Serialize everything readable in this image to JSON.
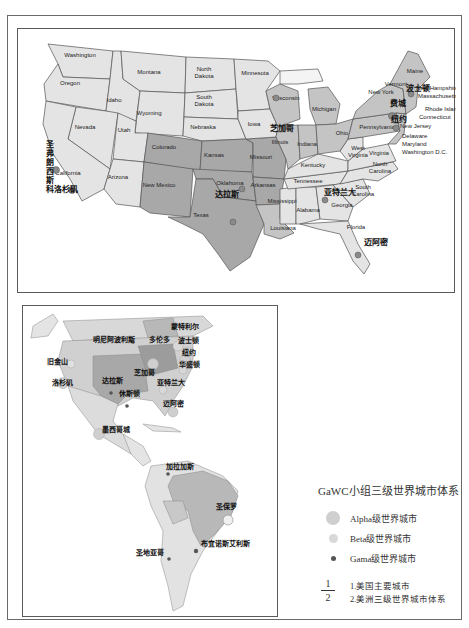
{
  "figure": {
    "panel_1_title": "美国主要城市",
    "panel_2_title": "美洲三级世界城市体系"
  },
  "us_map": {
    "states": [
      {
        "name": "Washington",
        "x": 62,
        "y": 28,
        "shade": "light"
      },
      {
        "name": "Oregon",
        "x": 52,
        "y": 56,
        "shade": "light"
      },
      {
        "name": "Idaho",
        "x": 96,
        "y": 73,
        "shade": "light"
      },
      {
        "name": "Montana",
        "x": 131,
        "y": 45,
        "shade": "light"
      },
      {
        "name": "Wyoming",
        "x": 131,
        "y": 86,
        "shade": "light"
      },
      {
        "name": "North Dakota",
        "x": 186,
        "y": 45,
        "shade": "light"
      },
      {
        "name": "South Dakota",
        "x": 186,
        "y": 73,
        "shade": "light"
      },
      {
        "name": "Nebraska",
        "x": 185,
        "y": 100,
        "shade": "light"
      },
      {
        "name": "Nevada",
        "x": 67,
        "y": 100,
        "shade": "light"
      },
      {
        "name": "Utah",
        "x": 106,
        "y": 103,
        "shade": "light"
      },
      {
        "name": "California",
        "x": 50,
        "y": 146,
        "shade": "light"
      },
      {
        "name": "Arizona",
        "x": 100,
        "y": 150,
        "shade": "light"
      },
      {
        "name": "Colorado",
        "x": 146,
        "y": 120,
        "shade": "dark"
      },
      {
        "name": "New Mexico",
        "x": 141,
        "y": 158,
        "shade": "dark"
      },
      {
        "name": "Kansas",
        "x": 196,
        "y": 128,
        "shade": "dark"
      },
      {
        "name": "Oklahoma",
        "x": 212,
        "y": 156,
        "shade": "dark"
      },
      {
        "name": "Texas",
        "x": 183,
        "y": 188,
        "shade": "dark"
      },
      {
        "name": "Minnesota",
        "x": 237,
        "y": 46,
        "shade": "light"
      },
      {
        "name": "Iowa",
        "x": 236,
        "y": 97,
        "shade": "light"
      },
      {
        "name": "Missouri",
        "x": 243,
        "y": 130,
        "shade": "dark"
      },
      {
        "name": "Arkansas",
        "x": 245,
        "y": 158,
        "shade": "dark"
      },
      {
        "name": "Louisiana",
        "x": 265,
        "y": 201,
        "shade": "mid"
      },
      {
        "name": "Wisconsin",
        "x": 268,
        "y": 71,
        "shade": "mid"
      },
      {
        "name": "Illinois",
        "x": 262,
        "y": 115,
        "shade": "mid"
      },
      {
        "name": "Michigan",
        "x": 306,
        "y": 82,
        "shade": "mid"
      },
      {
        "name": "Indiana",
        "x": 289,
        "y": 117,
        "shade": "mid"
      },
      {
        "name": "Ohio",
        "x": 324,
        "y": 106,
        "shade": "mid"
      },
      {
        "name": "Kentucky",
        "x": 295,
        "y": 138,
        "shade": "light"
      },
      {
        "name": "Tennessee",
        "x": 290,
        "y": 154,
        "shade": "light"
      },
      {
        "name": "Mississippi",
        "x": 264,
        "y": 174,
        "shade": "light"
      },
      {
        "name": "Alabama",
        "x": 290,
        "y": 183,
        "shade": "light"
      },
      {
        "name": "Georgia",
        "x": 324,
        "y": 178,
        "shade": "light"
      },
      {
        "name": "Florida",
        "x": 338,
        "y": 200,
        "shade": "light"
      },
      {
        "name": "South Carolina",
        "x": 345,
        "y": 163,
        "shade": "light"
      },
      {
        "name": "North Carolina",
        "x": 362,
        "y": 140,
        "shade": "light"
      },
      {
        "name": "Virginia",
        "x": 361,
        "y": 126,
        "shade": "light"
      },
      {
        "name": "West Virginia",
        "x": 340,
        "y": 124,
        "shade": "light"
      },
      {
        "name": "Pennsylvania",
        "x": 359,
        "y": 100,
        "shade": "mid"
      },
      {
        "name": "New York",
        "x": 363,
        "y": 65,
        "shade": "mid"
      },
      {
        "name": "Vermont",
        "x": 378,
        "y": 57,
        "shade": "mid"
      },
      {
        "name": "Maine",
        "x": 397,
        "y": 44,
        "shade": "mid"
      }
    ],
    "callouts": [
      {
        "name": "New Hampshire",
        "x": 398,
        "y": 61
      },
      {
        "name": "Massachusetts",
        "x": 400,
        "y": 69
      },
      {
        "name": "Rhode Island",
        "x": 407,
        "y": 82
      },
      {
        "name": "Connecticut",
        "x": 401,
        "y": 90
      },
      {
        "name": "New Jersey",
        "x": 382,
        "y": 99
      },
      {
        "name": "Delaware",
        "x": 384,
        "y": 109
      },
      {
        "name": "Maryland",
        "x": 384,
        "y": 117
      },
      {
        "name": "Washington D.C.",
        "x": 384,
        "y": 125
      }
    ],
    "cities": [
      {
        "name": "圣弗朗西斯科",
        "x": 28,
        "y": 118,
        "vertical": true
      },
      {
        "name": "洛杉矶",
        "x": 36,
        "y": 163
      },
      {
        "name": "达拉斯",
        "x": 197,
        "y": 168
      },
      {
        "name": "芝加哥",
        "x": 252,
        "y": 102
      },
      {
        "name": "亚特兰大",
        "x": 306,
        "y": 166
      },
      {
        "name": "迈阿密",
        "x": 346,
        "y": 216
      },
      {
        "name": "纽约",
        "x": 373,
        "y": 93
      },
      {
        "name": "波士顿",
        "x": 388,
        "y": 62
      },
      {
        "name": "费城",
        "x": 372,
        "y": 77
      }
    ]
  },
  "americas_map": {
    "cities": [
      {
        "name": "旧金山",
        "x": 24,
        "y": 58,
        "tier": "beta"
      },
      {
        "name": "明尼阿波利斯",
        "x": 70,
        "y": 36,
        "tier": "gama"
      },
      {
        "name": "多伦多",
        "x": 126,
        "y": 36,
        "tier": "alpha"
      },
      {
        "name": "蒙特利尔",
        "x": 148,
        "y": 23,
        "tier": "beta"
      },
      {
        "name": "波士顿",
        "x": 155,
        "y": 37,
        "tier": "beta"
      },
      {
        "name": "纽约",
        "x": 159,
        "y": 49,
        "tier": "alpha"
      },
      {
        "name": "华盛顿",
        "x": 156,
        "y": 61,
        "tier": "beta"
      },
      {
        "name": "芝加哥",
        "x": 111,
        "y": 69,
        "tier": "alpha"
      },
      {
        "name": "洛杉矶",
        "x": 29,
        "y": 79,
        "tier": "alpha"
      },
      {
        "name": "达拉斯",
        "x": 79,
        "y": 77,
        "tier": "beta"
      },
      {
        "name": "休斯顿",
        "x": 96,
        "y": 90,
        "tier": "gama"
      },
      {
        "name": "亚特兰大",
        "x": 134,
        "y": 79,
        "tier": "beta"
      },
      {
        "name": "迈阿密",
        "x": 140,
        "y": 100,
        "tier": "alpha"
      },
      {
        "name": "墨西哥城",
        "x": 79,
        "y": 126,
        "tier": "alpha"
      },
      {
        "name": "加拉加斯",
        "x": 143,
        "y": 163,
        "tier": "gama"
      },
      {
        "name": "圣保罗",
        "x": 193,
        "y": 203,
        "tier": "alpha"
      },
      {
        "name": "布宜诺斯艾利斯",
        "x": 178,
        "y": 240,
        "tier": "beta"
      },
      {
        "name": "圣地亚哥",
        "x": 113,
        "y": 249,
        "tier": "gama"
      }
    ]
  },
  "legend": {
    "title": "GaWC小组三级世界城市体系",
    "items": [
      {
        "label": "Alpha级世界城市",
        "symbol": "alpha"
      },
      {
        "label": "Beta级世界城市",
        "symbol": "beta"
      },
      {
        "label": "Gama级世界城市",
        "symbol": "gama"
      }
    ],
    "fraction_top": "1",
    "fraction_bottom": "2",
    "notes": [
      "1.美国主要城市",
      "2.美洲三级世界城市体系"
    ]
  },
  "colors": {
    "light_fill": "#e4e4e4",
    "mid_fill": "#c4c4c4",
    "dark_fill": "#a8a8a8",
    "border": "#555555",
    "city_dot": "#8a8a8a"
  }
}
